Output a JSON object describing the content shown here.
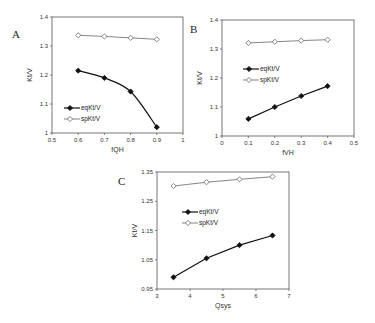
{
  "chart_data": [
    {
      "type": "line",
      "panel": "A",
      "xlabel": "fQH",
      "ylabel": "Kt/V",
      "xlim": [
        0.5,
        1
      ],
      "ylim": [
        1,
        1.4
      ],
      "xticks": [
        "0.5",
        "0.6",
        "0.7",
        "0.8",
        "0.9",
        "1"
      ],
      "yticks": [
        "1",
        "1.1",
        "1.2",
        "1.3",
        "1.4"
      ],
      "x": [
        0.6,
        0.7,
        0.8,
        0.9
      ],
      "series": [
        {
          "name": "eqKt/V",
          "values": [
            1.215,
            1.19,
            1.143,
            1.02
          ],
          "marker": "filled-diamond",
          "smooth": true
        },
        {
          "name": "spKt/V",
          "values": [
            1.337,
            1.333,
            1.328,
            1.323
          ],
          "marker": "open-diamond"
        }
      ],
      "legend": [
        "eqKt/V",
        "spKt/V"
      ],
      "legend_position": "lower-left",
      "grid": false
    },
    {
      "type": "line",
      "panel": "B",
      "xlabel": "fVH",
      "ylabel": "Kt/V",
      "xlim": [
        0,
        0.5
      ],
      "ylim": [
        1,
        1.4
      ],
      "xticks": [
        "0",
        "0.1",
        "0.2",
        "0.3",
        "0.4",
        "0.5"
      ],
      "yticks": [
        "1",
        "1.1",
        "1.2",
        "1.3",
        "1.4"
      ],
      "x": [
        0.1,
        0.2,
        0.3,
        0.4
      ],
      "series": [
        {
          "name": "eqKt/V",
          "values": [
            1.059,
            1.1,
            1.138,
            1.172
          ],
          "marker": "filled-diamond"
        },
        {
          "name": "spKt/V",
          "values": [
            1.321,
            1.325,
            1.329,
            1.332
          ],
          "marker": "open-diamond"
        }
      ],
      "legend": [
        "eqKt/V",
        "spKt/V"
      ],
      "legend_position": "middle-left",
      "grid": false
    },
    {
      "type": "line",
      "panel": "C",
      "xlabel": "Qsys",
      "ylabel": "Kt/V",
      "xlim": [
        3,
        7
      ],
      "ylim": [
        0.95,
        1.35
      ],
      "xticks": [
        "3",
        "4",
        "5",
        "6",
        "7"
      ],
      "yticks": [
        "0.95",
        "1.05",
        "1.15",
        "1.25",
        "1.35"
      ],
      "x": [
        3.5,
        4.5,
        5.5,
        6.5
      ],
      "series": [
        {
          "name": "eqKt/V",
          "values": [
            0.99,
            1.055,
            1.1,
            1.133
          ],
          "marker": "filled-diamond"
        },
        {
          "name": "spKt/V",
          "values": [
            1.302,
            1.315,
            1.325,
            1.334
          ],
          "marker": "open-diamond"
        }
      ],
      "legend": [
        "eqKt/V",
        "spKt/V"
      ],
      "legend_position": "middle-left",
      "grid": false
    }
  ],
  "panels": {
    "A": {
      "label": "A"
    },
    "B": {
      "label": "B"
    },
    "C": {
      "label": "C"
    }
  },
  "colors": {
    "eq": "#111111",
    "sp": "#777777",
    "axis": "#555555"
  }
}
